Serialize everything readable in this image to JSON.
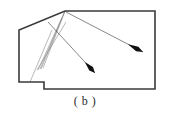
{
  "figure": {
    "caption": "( b )",
    "background_color": "#ffffff",
    "outline_color": "#3a3a3a",
    "ray_color": "#8a8a8a",
    "arrow_color": "#111111",
    "outline_width": 1.6,
    "ray_width": 0.6,
    "room_polygon": {
      "name": "room-outline",
      "points": "65,11 155,11 155,89 44,89 44,82 19,82 19,30",
      "vertices": [
        {
          "x": 65,
          "y": 11,
          "label": "apex-top-left"
        },
        {
          "x": 155,
          "y": 11,
          "label": "top-right"
        },
        {
          "x": 155,
          "y": 89,
          "label": "bottom-right"
        },
        {
          "x": 44,
          "y": 89,
          "label": "notch-bottom-right"
        },
        {
          "x": 44,
          "y": 82,
          "label": "notch-inner-corner"
        },
        {
          "x": 19,
          "y": 82,
          "label": "notch-bottom-left"
        },
        {
          "x": 19,
          "y": 30,
          "label": "left-upper"
        }
      ]
    },
    "source_point": {
      "x": 65,
      "y": 11,
      "label": "light-source"
    },
    "focus_point": {
      "x": 40,
      "y": 69,
      "label": "ray-convergence"
    },
    "rays": [
      {
        "name": "ray-1",
        "x1": 65,
        "y1": 11,
        "x2": 38,
        "y2": 70
      },
      {
        "name": "ray-2",
        "x1": 65,
        "y1": 11,
        "x2": 41,
        "y2": 69
      },
      {
        "name": "ray-3",
        "x1": 65,
        "y1": 11,
        "x2": 43,
        "y2": 68
      },
      {
        "name": "ray-4",
        "x1": 37,
        "y1": 70,
        "x2": 66,
        "y2": 22
      },
      {
        "name": "ray-5",
        "x1": 40,
        "y1": 69,
        "x2": 62,
        "y2": 18
      },
      {
        "name": "ray-6",
        "x1": 30,
        "y1": 82,
        "x2": 52,
        "y2": 30
      }
    ],
    "arrows": [
      {
        "name": "arrow-center",
        "x1": 48,
        "y1": 22,
        "x2": 95,
        "y2": 73,
        "head_length": 15,
        "head_width": 5,
        "direction": "down-right"
      },
      {
        "name": "arrow-right",
        "x1": 66,
        "y1": 12,
        "x2": 143,
        "y2": 52,
        "head_length": 17,
        "head_width": 5,
        "direction": "right-down"
      }
    ]
  }
}
